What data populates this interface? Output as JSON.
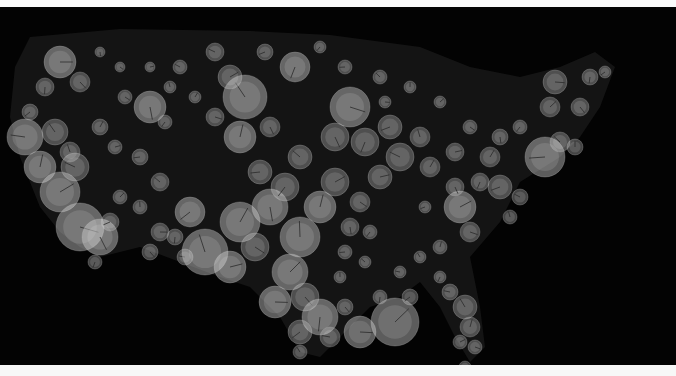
{
  "chart_data": {
    "type": "scatter",
    "subtype": "bubble-map",
    "title": "",
    "xlabel": "",
    "ylabel": "",
    "legend": null,
    "grid": false,
    "region": "Contiguous United States",
    "canvas": {
      "width": 676,
      "height": 358,
      "offset_y": 7
    },
    "colors": {
      "background": "#030303",
      "land": "#141414",
      "bubble_fill": "#d9d9d9",
      "bubble_stroke": "#bdbdbd",
      "tick": "#2a2a2a",
      "top_bar": "#fafafa",
      "bottom_bar": "#f7f7f7"
    },
    "land_outline": [
      [
        30,
        30
      ],
      [
        120,
        22
      ],
      [
        250,
        24
      ],
      [
        330,
        28
      ],
      [
        420,
        40
      ],
      [
        470,
        60
      ],
      [
        520,
        70
      ],
      [
        560,
        60
      ],
      [
        595,
        45
      ],
      [
        615,
        60
      ],
      [
        600,
        100
      ],
      [
        580,
        130
      ],
      [
        560,
        150
      ],
      [
        520,
        175
      ],
      [
        500,
        215
      ],
      [
        470,
        250
      ],
      [
        480,
        300
      ],
      [
        485,
        340
      ],
      [
        470,
        355
      ],
      [
        455,
        330
      ],
      [
        440,
        300
      ],
      [
        420,
        275
      ],
      [
        400,
        290
      ],
      [
        370,
        300
      ],
      [
        340,
        330
      ],
      [
        320,
        350
      ],
      [
        300,
        345
      ],
      [
        280,
        310
      ],
      [
        250,
        280
      ],
      [
        220,
        270
      ],
      [
        180,
        255
      ],
      [
        140,
        240
      ],
      [
        100,
        250
      ],
      [
        80,
        240
      ],
      [
        60,
        225
      ],
      [
        40,
        200
      ],
      [
        20,
        150
      ],
      [
        10,
        110
      ],
      [
        15,
        60
      ]
    ],
    "points": [
      {
        "x": 60,
        "y": 55,
        "r": 16
      },
      {
        "x": 80,
        "y": 75,
        "r": 10
      },
      {
        "x": 45,
        "y": 80,
        "r": 9
      },
      {
        "x": 30,
        "y": 105,
        "r": 8
      },
      {
        "x": 25,
        "y": 130,
        "r": 18
      },
      {
        "x": 55,
        "y": 125,
        "r": 13
      },
      {
        "x": 40,
        "y": 160,
        "r": 16
      },
      {
        "x": 60,
        "y": 185,
        "r": 20
      },
      {
        "x": 80,
        "y": 220,
        "r": 24
      },
      {
        "x": 100,
        "y": 230,
        "r": 18
      },
      {
        "x": 95,
        "y": 255,
        "r": 7
      },
      {
        "x": 110,
        "y": 215,
        "r": 9
      },
      {
        "x": 75,
        "y": 160,
        "r": 14
      },
      {
        "x": 70,
        "y": 145,
        "r": 10
      },
      {
        "x": 100,
        "y": 120,
        "r": 8
      },
      {
        "x": 115,
        "y": 140,
        "r": 7
      },
      {
        "x": 125,
        "y": 90,
        "r": 7
      },
      {
        "x": 150,
        "y": 100,
        "r": 16
      },
      {
        "x": 165,
        "y": 115,
        "r": 7
      },
      {
        "x": 140,
        "y": 150,
        "r": 8
      },
      {
        "x": 160,
        "y": 175,
        "r": 9
      },
      {
        "x": 140,
        "y": 200,
        "r": 7
      },
      {
        "x": 120,
        "y": 190,
        "r": 7
      },
      {
        "x": 160,
        "y": 225,
        "r": 9
      },
      {
        "x": 150,
        "y": 245,
        "r": 8
      },
      {
        "x": 175,
        "y": 230,
        "r": 8
      },
      {
        "x": 190,
        "y": 205,
        "r": 15
      },
      {
        "x": 185,
        "y": 250,
        "r": 8
      },
      {
        "x": 245,
        "y": 90,
        "r": 22
      },
      {
        "x": 240,
        "y": 130,
        "r": 16
      },
      {
        "x": 230,
        "y": 70,
        "r": 12
      },
      {
        "x": 215,
        "y": 110,
        "r": 9
      },
      {
        "x": 270,
        "y": 120,
        "r": 10
      },
      {
        "x": 295,
        "y": 60,
        "r": 15
      },
      {
        "x": 265,
        "y": 45,
        "r": 8
      },
      {
        "x": 215,
        "y": 45,
        "r": 9
      },
      {
        "x": 205,
        "y": 245,
        "r": 23
      },
      {
        "x": 240,
        "y": 215,
        "r": 20
      },
      {
        "x": 230,
        "y": 260,
        "r": 16
      },
      {
        "x": 255,
        "y": 240,
        "r": 14
      },
      {
        "x": 270,
        "y": 200,
        "r": 18
      },
      {
        "x": 285,
        "y": 180,
        "r": 14
      },
      {
        "x": 260,
        "y": 165,
        "r": 12
      },
      {
        "x": 300,
        "y": 150,
        "r": 12
      },
      {
        "x": 300,
        "y": 230,
        "r": 20
      },
      {
        "x": 290,
        "y": 265,
        "r": 18
      },
      {
        "x": 275,
        "y": 295,
        "r": 16
      },
      {
        "x": 305,
        "y": 290,
        "r": 14
      },
      {
        "x": 320,
        "y": 310,
        "r": 18
      },
      {
        "x": 300,
        "y": 325,
        "r": 12
      },
      {
        "x": 330,
        "y": 330,
        "r": 10
      },
      {
        "x": 300,
        "y": 345,
        "r": 7
      },
      {
        "x": 320,
        "y": 200,
        "r": 16
      },
      {
        "x": 335,
        "y": 175,
        "r": 14
      },
      {
        "x": 350,
        "y": 100,
        "r": 20
      },
      {
        "x": 335,
        "y": 130,
        "r": 14
      },
      {
        "x": 365,
        "y": 135,
        "r": 14
      },
      {
        "x": 390,
        "y": 120,
        "r": 12
      },
      {
        "x": 400,
        "y": 150,
        "r": 14
      },
      {
        "x": 420,
        "y": 130,
        "r": 10
      },
      {
        "x": 430,
        "y": 160,
        "r": 10
      },
      {
        "x": 380,
        "y": 170,
        "r": 12
      },
      {
        "x": 360,
        "y": 195,
        "r": 10
      },
      {
        "x": 350,
        "y": 220,
        "r": 9
      },
      {
        "x": 370,
        "y": 225,
        "r": 7
      },
      {
        "x": 345,
        "y": 245,
        "r": 7
      },
      {
        "x": 365,
        "y": 255,
        "r": 6
      },
      {
        "x": 340,
        "y": 270,
        "r": 6
      },
      {
        "x": 395,
        "y": 315,
        "r": 24
      },
      {
        "x": 360,
        "y": 325,
        "r": 16
      },
      {
        "x": 345,
        "y": 300,
        "r": 8
      },
      {
        "x": 380,
        "y": 290,
        "r": 7
      },
      {
        "x": 410,
        "y": 290,
        "r": 8
      },
      {
        "x": 400,
        "y": 265,
        "r": 6
      },
      {
        "x": 420,
        "y": 250,
        "r": 6
      },
      {
        "x": 440,
        "y": 240,
        "r": 7
      },
      {
        "x": 460,
        "y": 200,
        "r": 16
      },
      {
        "x": 470,
        "y": 225,
        "r": 10
      },
      {
        "x": 455,
        "y": 180,
        "r": 9
      },
      {
        "x": 480,
        "y": 175,
        "r": 9
      },
      {
        "x": 500,
        "y": 180,
        "r": 12
      },
      {
        "x": 520,
        "y": 190,
        "r": 8
      },
      {
        "x": 510,
        "y": 210,
        "r": 7
      },
      {
        "x": 490,
        "y": 150,
        "r": 10
      },
      {
        "x": 455,
        "y": 145,
        "r": 9
      },
      {
        "x": 470,
        "y": 120,
        "r": 7
      },
      {
        "x": 500,
        "y": 130,
        "r": 8
      },
      {
        "x": 520,
        "y": 120,
        "r": 7
      },
      {
        "x": 545,
        "y": 150,
        "r": 20
      },
      {
        "x": 560,
        "y": 135,
        "r": 10
      },
      {
        "x": 575,
        "y": 140,
        "r": 8
      },
      {
        "x": 550,
        "y": 100,
        "r": 10
      },
      {
        "x": 555,
        "y": 75,
        "r": 12
      },
      {
        "x": 580,
        "y": 100,
        "r": 9
      },
      {
        "x": 590,
        "y": 70,
        "r": 8
      },
      {
        "x": 605,
        "y": 65,
        "r": 6
      },
      {
        "x": 450,
        "y": 285,
        "r": 8
      },
      {
        "x": 465,
        "y": 300,
        "r": 12
      },
      {
        "x": 470,
        "y": 320,
        "r": 10
      },
      {
        "x": 460,
        "y": 335,
        "r": 7
      },
      {
        "x": 475,
        "y": 340,
        "r": 7
      },
      {
        "x": 465,
        "y": 360,
        "r": 6
      },
      {
        "x": 440,
        "y": 270,
        "r": 6
      },
      {
        "x": 425,
        "y": 200,
        "r": 6
      },
      {
        "x": 180,
        "y": 60,
        "r": 7
      },
      {
        "x": 170,
        "y": 80,
        "r": 6
      },
      {
        "x": 195,
        "y": 90,
        "r": 6
      },
      {
        "x": 150,
        "y": 60,
        "r": 5
      },
      {
        "x": 120,
        "y": 60,
        "r": 5
      },
      {
        "x": 100,
        "y": 45,
        "r": 5
      },
      {
        "x": 320,
        "y": 40,
        "r": 6
      },
      {
        "x": 345,
        "y": 60,
        "r": 7
      },
      {
        "x": 380,
        "y": 70,
        "r": 7
      },
      {
        "x": 410,
        "y": 80,
        "r": 6
      },
      {
        "x": 440,
        "y": 95,
        "r": 6
      },
      {
        "x": 385,
        "y": 95,
        "r": 6
      }
    ]
  }
}
